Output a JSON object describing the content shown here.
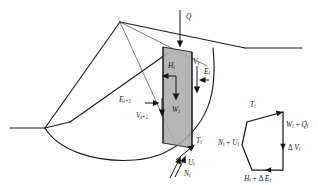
{
  "figure": {
    "width": 318,
    "height": 185,
    "background_color": "#ffffff",
    "line_color": "#1d1d1d",
    "slice_fill_color": "#acacac"
  },
  "labels": {
    "surcharge": {
      "base": "Q",
      "sub": ""
    },
    "horizontal_force": {
      "base": "H",
      "sub": "i"
    },
    "weight": {
      "base": "W",
      "sub": "i"
    },
    "vertical_interslice_right": {
      "base": "V",
      "sub": "i"
    },
    "horizontal_interslice_right": {
      "base": "E",
      "sub": "i"
    },
    "horizontal_interslice_left": {
      "base": "E",
      "sub": "i+1"
    },
    "vertical_interslice_left": {
      "base": "V",
      "sub": "i+1"
    },
    "shear_base": {
      "base": "T",
      "sub": "i"
    },
    "porewater_base": {
      "base": "U",
      "sub": "i"
    },
    "normal_base": {
      "base": "N",
      "sub": "i"
    }
  },
  "polygon": {
    "shear": {
      "base": "T",
      "sub": "i"
    },
    "weight_plus_surcharge": {
      "base": "W",
      "sub": "i",
      "op": " + ",
      "base2": "Q",
      "sub2": "i"
    },
    "delta_vertical": {
      "op": "Δ ",
      "base": "V",
      "sub": "i"
    },
    "normal_plus_porewater": {
      "base": "N",
      "sub": "i",
      "op": " + ",
      "base2": "U",
      "sub2": "i"
    },
    "horizontal_plus_delta": {
      "base": "H",
      "sub": "i",
      "op": " + Δ ",
      "base2": "E",
      "sub2": "i"
    }
  },
  "geometry": {
    "ground_left_y": 128,
    "toe_x": 45,
    "crest_x": 245,
    "crest_y": 48,
    "apex_x": 120,
    "apex_y": 22,
    "slice_left_x": 163,
    "slice_right_x": 192
  }
}
